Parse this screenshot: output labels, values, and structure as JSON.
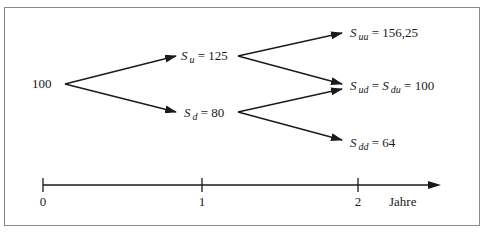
{
  "diagram": {
    "type": "binomial-tree",
    "nodes": {
      "root": {
        "value": "100"
      },
      "u": {
        "symbol": "S",
        "sub": "u",
        "eq": "=",
        "value": "125"
      },
      "d": {
        "symbol": "S",
        "sub": "d",
        "eq": "=",
        "value": "80"
      },
      "uu": {
        "symbol": "S",
        "sub": "uu",
        "eq": "=",
        "value": "156,25"
      },
      "ud": {
        "symbol": "S",
        "sub": "ud",
        "eq": "=",
        "symbol2": "S",
        "sub2": "du",
        "eq2": "=",
        "value": "100"
      },
      "dd": {
        "symbol": "S",
        "sub": "dd",
        "eq": "=",
        "value": "64"
      }
    },
    "edges": [
      [
        "root",
        "u"
      ],
      [
        "root",
        "d"
      ],
      [
        "u",
        "uu"
      ],
      [
        "u",
        "ud"
      ],
      [
        "d",
        "ud"
      ],
      [
        "d",
        "dd"
      ]
    ],
    "axis": {
      "ticks": [
        "0",
        "1",
        "2"
      ],
      "label": "Jahre"
    },
    "colors": {
      "line": "#1a1a1a",
      "frame": "#8a8a8a",
      "background": "#ffffff"
    }
  }
}
